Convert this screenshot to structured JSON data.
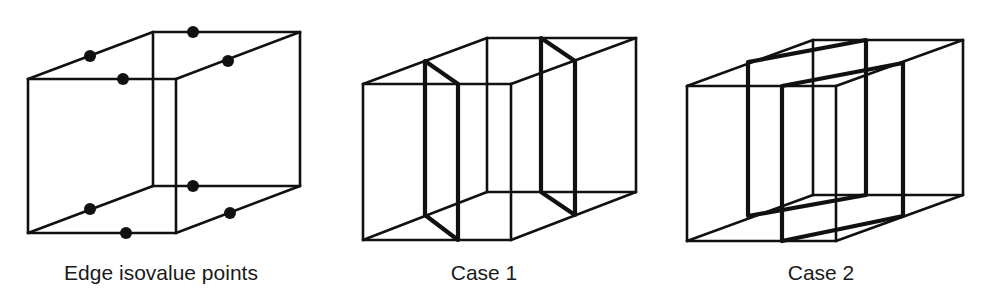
{
  "colors": {
    "ink": "#111111",
    "background": "#ffffff"
  },
  "panels": [
    {
      "id": "edge-points",
      "label": "Edge isovalue points",
      "cube": {
        "ftl": [
          28,
          79
        ],
        "ftr": [
          176,
          79
        ],
        "fbl": [
          28,
          233
        ],
        "fbr": [
          176,
          233
        ],
        "btl": [
          153,
          32
        ],
        "btr": [
          300,
          32
        ],
        "bbl": [
          153,
          186
        ],
        "bbr": [
          300,
          186
        ]
      },
      "points": [
        [
          90,
          56
        ],
        [
          193,
          32
        ],
        [
          123,
          79
        ],
        [
          228,
          61
        ],
        [
          90,
          209
        ],
        [
          193,
          186
        ],
        [
          126,
          233
        ],
        [
          230,
          213
        ]
      ],
      "label_pos": [
        161,
        280
      ]
    },
    {
      "id": "case-1",
      "label": "Case 1",
      "cube": {
        "ftl": [
          363,
          84
        ],
        "ftr": [
          511,
          84
        ],
        "fbl": [
          363,
          240
        ],
        "fbr": [
          511,
          240
        ],
        "btl": [
          487,
          38
        ],
        "btr": [
          636,
          38
        ],
        "bbl": [
          487,
          192
        ],
        "bbr": [
          636,
          192
        ]
      },
      "planes": [
        [
          [
            425,
            61
          ],
          [
            458,
            84
          ],
          [
            458,
            240
          ],
          [
            425,
            215
          ]
        ],
        [
          [
            541,
            38
          ],
          [
            575,
            61
          ],
          [
            575,
            215
          ],
          [
            541,
            192
          ]
        ]
      ],
      "label_pos": [
        484,
        280
      ]
    },
    {
      "id": "case-2",
      "label": "Case 2",
      "cube": {
        "ftl": [
          687,
          86
        ],
        "ftr": [
          836,
          86
        ],
        "fbl": [
          687,
          241
        ],
        "fbr": [
          836,
          241
        ],
        "btl": [
          813,
          40
        ],
        "btr": [
          963,
          40
        ],
        "bbl": [
          813,
          195
        ],
        "bbr": [
          963,
          195
        ]
      },
      "planes": [
        [
          [
            748,
            62
          ],
          [
            866,
            40
          ],
          [
            866,
            195
          ],
          [
            748,
            216
          ]
        ],
        [
          [
            782,
            86
          ],
          [
            903,
            63
          ],
          [
            903,
            216
          ],
          [
            782,
            241
          ]
        ]
      ],
      "label_pos": [
        821,
        280
      ]
    }
  ]
}
